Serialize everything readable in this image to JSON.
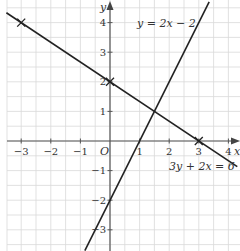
{
  "chart_data": {
    "type": "line",
    "title": "",
    "xlabel": "x",
    "ylabel": "y",
    "origin_label": "O",
    "xlim": [
      -3.5,
      4.3
    ],
    "ylim": [
      -3.7,
      4.7
    ],
    "x_ticks": [
      -3,
      -2,
      -1,
      1,
      2,
      3,
      4
    ],
    "y_ticks": [
      -3,
      -2,
      -1,
      1,
      2,
      3,
      4
    ],
    "x_tick_labels": [
      "−3",
      "−2",
      "−1",
      "1",
      "2",
      "3",
      "4"
    ],
    "y_tick_labels": [
      "−3",
      "−2",
      "−1",
      "1",
      "2",
      "3",
      "4"
    ],
    "grid": true,
    "grid_minor_step": 0.5,
    "series": [
      {
        "name": "y = 2x − 2",
        "equation": "y = 2x − 2",
        "x": [
          -0.85,
          3.35
        ],
        "y": [
          -3.7,
          4.7
        ],
        "color": "#222222"
      },
      {
        "name": "3y + 2x = 6",
        "equation": "3y + 2x = 6",
        "x": [
          -3.5,
          4.3
        ],
        "y": [
          4.333,
          -0.867
        ],
        "color": "#222222"
      }
    ],
    "marked_points": [
      {
        "x": -3,
        "y": 4,
        "marker": "x"
      },
      {
        "x": 0,
        "y": 2,
        "marker": "x"
      },
      {
        "x": 3,
        "y": 0,
        "marker": "x"
      }
    ],
    "annotations": [
      {
        "text": "y = 2x − 2",
        "x": 0.9,
        "y": 4.15
      },
      {
        "text": "3y + 2x = 6",
        "x": 3.0,
        "y": -0.55
      }
    ]
  },
  "labels": {
    "eq1": "y = 2x − 2",
    "eq2": "3y + 2x = 6",
    "x_axis": "x",
    "y_axis": "y",
    "origin": "O"
  }
}
